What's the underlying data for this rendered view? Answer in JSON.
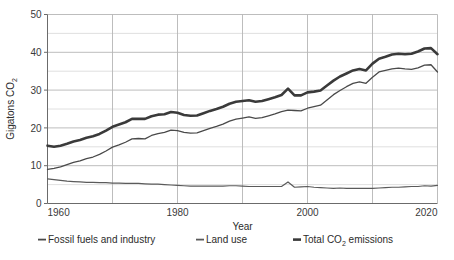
{
  "chart_data": {
    "type": "line",
    "title": "",
    "xlabel": "Year",
    "ylabel": "Gigatons CO₂",
    "ylabel_main": "Gigatons CO",
    "ylabel_sub": "2",
    "xlim": [
      1960,
      2020
    ],
    "ylim": [
      0,
      50
    ],
    "grid": true,
    "grid_y_major_step": 10,
    "grid_y_minor_step": 5,
    "grid_x_step": 10,
    "y_ticks": [
      0,
      10,
      20,
      30,
      40,
      50
    ],
    "y_tick_labels": [
      "0",
      "10",
      "20",
      "30",
      "40",
      "50"
    ],
    "x_ticks": [
      1960,
      1980,
      2000,
      2020
    ],
    "x_tick_labels": [
      "1960",
      "1980",
      "2000",
      "2020"
    ],
    "x_minor_ticks": [
      1970,
      1990,
      2010
    ],
    "legend_position": "bottom",
    "x": [
      1960,
      1961,
      1962,
      1963,
      1964,
      1965,
      1966,
      1967,
      1968,
      1969,
      1970,
      1971,
      1972,
      1973,
      1974,
      1975,
      1976,
      1977,
      1978,
      1979,
      1980,
      1981,
      1982,
      1983,
      1984,
      1985,
      1986,
      1987,
      1988,
      1989,
      1990,
      1991,
      1992,
      1993,
      1994,
      1995,
      1996,
      1997,
      1998,
      1999,
      2000,
      2001,
      2002,
      2003,
      2004,
      2005,
      2006,
      2007,
      2008,
      2009,
      2010,
      2011,
      2012,
      2013,
      2014,
      2015,
      2016,
      2017,
      2018,
      2019,
      2020
    ],
    "series": [
      {
        "name": "Total CO₂ emissions",
        "label_main": "Total CO",
        "label_sub": "2",
        "label_tail": " emissions",
        "color": "#3a3a3a",
        "width": 2.6,
        "values": [
          15.3,
          15.0,
          15.3,
          15.8,
          16.4,
          16.8,
          17.4,
          17.8,
          18.4,
          19.3,
          20.3,
          20.9,
          21.5,
          22.4,
          22.4,
          22.4,
          23.1,
          23.5,
          23.6,
          24.2,
          24.0,
          23.4,
          23.2,
          23.3,
          23.9,
          24.5,
          25.0,
          25.6,
          26.4,
          26.9,
          27.1,
          27.3,
          26.9,
          27.1,
          27.6,
          28.1,
          28.7,
          30.4,
          28.6,
          28.6,
          29.4,
          29.6,
          29.9,
          31.2,
          32.5,
          33.6,
          34.4,
          35.2,
          35.6,
          35.2,
          37.0,
          38.3,
          38.8,
          39.4,
          39.6,
          39.5,
          39.6,
          40.2,
          41.0,
          41.1,
          39.5
        ]
      },
      {
        "name": "Fossil fuels and industry",
        "label_main": "Fossil fuels and industry",
        "color": "#4a4a4a",
        "width": 1.3,
        "values": [
          9.0,
          9.3,
          9.7,
          10.3,
          10.9,
          11.3,
          11.9,
          12.3,
          13.0,
          13.9,
          14.9,
          15.5,
          16.2,
          17.1,
          17.2,
          17.1,
          18.0,
          18.5,
          18.8,
          19.4,
          19.3,
          18.8,
          18.6,
          18.7,
          19.3,
          19.9,
          20.4,
          21.0,
          21.8,
          22.3,
          22.6,
          22.9,
          22.5,
          22.7,
          23.2,
          23.7,
          24.3,
          24.7,
          24.6,
          24.5,
          25.2,
          25.6,
          26.0,
          27.4,
          28.8,
          29.9,
          30.9,
          31.8,
          32.2,
          31.8,
          33.4,
          34.8,
          35.2,
          35.6,
          35.8,
          35.6,
          35.5,
          35.9,
          36.6,
          36.7,
          34.8
        ]
      },
      {
        "name": "Land use",
        "label_main": "Land use",
        "color": "#5a5a5a",
        "width": 1.2,
        "values": [
          6.5,
          6.3,
          6.1,
          5.9,
          5.8,
          5.7,
          5.6,
          5.6,
          5.5,
          5.5,
          5.4,
          5.4,
          5.3,
          5.3,
          5.3,
          5.2,
          5.1,
          5.1,
          5.0,
          4.9,
          4.8,
          4.7,
          4.6,
          4.6,
          4.6,
          4.6,
          4.6,
          4.6,
          4.7,
          4.7,
          4.6,
          4.5,
          4.5,
          4.5,
          4.5,
          4.5,
          4.5,
          5.7,
          4.3,
          4.4,
          4.5,
          4.3,
          4.2,
          4.1,
          4.0,
          4.1,
          4.0,
          4.0,
          4.0,
          4.0,
          4.0,
          4.1,
          4.2,
          4.3,
          4.3,
          4.4,
          4.5,
          4.5,
          4.7,
          4.6,
          4.8
        ]
      }
    ],
    "annotations": []
  },
  "legend": {
    "items": [
      {
        "key": "fossil",
        "label": "Fossil fuels and industry"
      },
      {
        "key": "landuse",
        "label": "Land use"
      },
      {
        "key": "total",
        "label": "Total CO₂ emissions"
      }
    ]
  },
  "colors": {
    "axis": "#6b6b6b",
    "grid_major": "#b5b5b5",
    "grid_minor": "#d8d8d8",
    "text": "#2b2b2b",
    "total_line": "#3a3a3a",
    "fossil_line": "#4a4a4a",
    "landuse_line": "#5a5a5a",
    "background": "#ffffff"
  }
}
